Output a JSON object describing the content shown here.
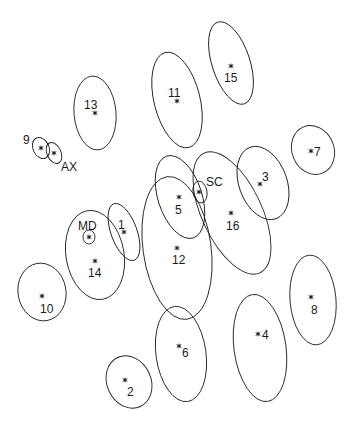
{
  "diagram": {
    "type": "ellipse-cluster-map",
    "stroke_color": "#222222",
    "background": "#ffffff",
    "items": [
      {
        "id": "13",
        "label": "13",
        "cx": 95,
        "cy": 113,
        "rx": 21,
        "ry": 37,
        "rot": -5,
        "sx": 95,
        "sy": 113,
        "lx": 84,
        "ly": 109
      },
      {
        "id": "11",
        "label": "11",
        "cx": 177,
        "cy": 100,
        "rx": 23,
        "ry": 49,
        "rot": -14,
        "sx": 177,
        "sy": 101,
        "lx": 168,
        "ly": 97
      },
      {
        "id": "15",
        "label": "15",
        "cx": 231,
        "cy": 63,
        "rx": 19,
        "ry": 43,
        "rot": -18,
        "sx": 231,
        "sy": 66,
        "lx": 224,
        "ly": 82
      },
      {
        "id": "9",
        "label": "9",
        "cx": 41,
        "cy": 148,
        "rx": 8,
        "ry": 11,
        "rot": -25,
        "sx": 41,
        "sy": 148,
        "lx": 23,
        "ly": 144
      },
      {
        "id": "AX",
        "label": "AX",
        "cx": 54,
        "cy": 153,
        "rx": 7,
        "ry": 11,
        "rot": -25,
        "sx": 54,
        "sy": 153,
        "lx": 61,
        "ly": 171
      },
      {
        "id": "7",
        "label": "7",
        "cx": 313,
        "cy": 150,
        "rx": 21,
        "ry": 25,
        "rot": -22,
        "sx": 311,
        "sy": 151,
        "lx": 314,
        "ly": 156
      },
      {
        "id": "5",
        "label": "5",
        "cx": 180,
        "cy": 197,
        "rx": 22,
        "ry": 43,
        "rot": -18,
        "sx": 179,
        "sy": 197,
        "lx": 175,
        "ly": 214
      },
      {
        "id": "SC",
        "label": "SC",
        "cx": 200,
        "cy": 192,
        "rx": 7,
        "ry": 11,
        "rot": -10,
        "sx": 199,
        "sy": 192,
        "lx": 206,
        "ly": 186
      },
      {
        "id": "3",
        "label": "3",
        "cx": 263,
        "cy": 183,
        "rx": 24,
        "ry": 38,
        "rot": -20,
        "sx": 260,
        "sy": 184,
        "lx": 262,
        "ly": 181
      },
      {
        "id": "16",
        "label": "16",
        "cx": 232,
        "cy": 213,
        "rx": 30,
        "ry": 66,
        "rot": -25,
        "sx": 231,
        "sy": 213,
        "lx": 226,
        "ly": 230
      },
      {
        "id": "12",
        "label": "12",
        "cx": 177,
        "cy": 248,
        "rx": 34,
        "ry": 72,
        "rot": -8,
        "sx": 177,
        "sy": 248,
        "lx": 172,
        "ly": 264
      },
      {
        "id": "1",
        "label": "1",
        "cx": 124,
        "cy": 232,
        "rx": 13,
        "ry": 30,
        "rot": -20,
        "sx": 124,
        "sy": 232,
        "lx": 118,
        "ly": 229
      },
      {
        "id": "14",
        "label": "14",
        "cx": 95,
        "cy": 255,
        "rx": 29,
        "ry": 45,
        "rot": -10,
        "sx": 95,
        "sy": 261,
        "lx": 88,
        "ly": 277
      },
      {
        "id": "MD",
        "label": "MD",
        "cx": 89,
        "cy": 237,
        "rx": 6,
        "ry": 7,
        "rot": 0,
        "sx": 89,
        "sy": 237,
        "lx": 78,
        "ly": 230
      },
      {
        "id": "10",
        "label": "10",
        "cx": 42,
        "cy": 292,
        "rx": 24,
        "ry": 29,
        "rot": -10,
        "sx": 42,
        "sy": 296,
        "lx": 40,
        "ly": 313
      },
      {
        "id": "6",
        "label": "6",
        "cx": 181,
        "cy": 354,
        "rx": 25,
        "ry": 48,
        "rot": -8,
        "sx": 179,
        "sy": 346,
        "lx": 182,
        "ly": 357
      },
      {
        "id": "4",
        "label": "4",
        "cx": 260,
        "cy": 348,
        "rx": 26,
        "ry": 54,
        "rot": -8,
        "sx": 258,
        "sy": 334,
        "lx": 262,
        "ly": 339
      },
      {
        "id": "8",
        "label": "8",
        "cx": 313,
        "cy": 300,
        "rx": 23,
        "ry": 45,
        "rot": -5,
        "sx": 311,
        "sy": 297,
        "lx": 311,
        "ly": 314
      },
      {
        "id": "2",
        "label": "2",
        "cx": 129,
        "cy": 382,
        "rx": 22,
        "ry": 27,
        "rot": -25,
        "sx": 125,
        "sy": 380,
        "lx": 127,
        "ly": 396
      }
    ]
  }
}
